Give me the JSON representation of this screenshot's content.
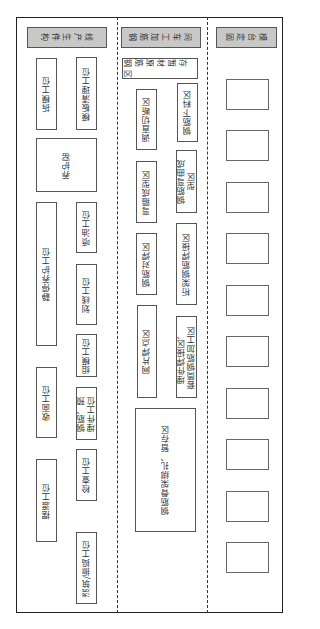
{
  "diagram": {
    "type": "factory-layout",
    "orientation_note": "rotated 90 degrees; labels read bottom-to-top",
    "sections": [
      {
        "id": "production-line",
        "header": "构件生产线",
        "stations": [
          {
            "label": "拆模工位",
            "x": 36,
            "y": 58,
            "w": 21,
            "h": 72
          },
          {
            "label": "模板清理工位",
            "x": 76,
            "y": 57,
            "w": 21,
            "h": 73
          },
          {
            "label": "养护窑",
            "x": 36,
            "y": 138,
            "w": 61,
            "h": 54
          },
          {
            "label": "静停养护工位",
            "x": 36,
            "y": 202,
            "w": 21,
            "h": 144
          },
          {
            "label": "喷油工位",
            "x": 76,
            "y": 202,
            "w": 21,
            "h": 51
          },
          {
            "label": "划线工位",
            "x": 76,
            "y": 264,
            "w": 21,
            "h": 61
          },
          {
            "label": "组模工位",
            "x": 76,
            "y": 334,
            "w": 21,
            "h": 43
          },
          {
            "label": "收面工位",
            "x": 36,
            "y": 367,
            "w": 21,
            "h": 71
          },
          {
            "label": "钢筋、预\n埋件工位",
            "x": 76,
            "y": 387,
            "w": 21,
            "h": 53
          },
          {
            "label": "检查工位",
            "x": 76,
            "y": 449,
            "w": 21,
            "h": 52
          },
          {
            "label": "摆渡工位",
            "x": 36,
            "y": 459,
            "w": 21,
            "h": 83
          },
          {
            "label": "浇筑/振捣工位",
            "x": 76,
            "y": 532,
            "w": 21,
            "h": 72
          }
        ]
      },
      {
        "id": "rebar-workshop",
        "header": "钢筋加工车间",
        "areas": [
          {
            "label": "钢筋原材暂存区",
            "x": 122,
            "y": 58,
            "w": 76,
            "h": 21,
            "horizontal": true
          },
          {
            "label": "钢筋下料区",
            "x": 177,
            "y": 83,
            "w": 21,
            "h": 59
          },
          {
            "label": "调直切断区",
            "x": 136,
            "y": 89,
            "w": 21,
            "h": 61
          },
          {
            "label": "钢筋弯曲成\n型区",
            "x": 176,
            "y": 150,
            "w": 21,
            "h": 63
          },
          {
            "label": "弯箍成型区",
            "x": 136,
            "y": 161,
            "w": 21,
            "h": 62
          },
          {
            "label": "桁架钢筋焊接区",
            "x": 176,
            "y": 223,
            "w": 21,
            "h": 82
          },
          {
            "label": "钢筋对焊区",
            "x": 136,
            "y": 233,
            "w": 21,
            "h": 62
          },
          {
            "label": "网片焊点区",
            "x": 137,
            "y": 305,
            "w": 20,
            "h": 93
          },
          {
            "label": "埋件焊接区、\n套筒钢筋加工区",
            "x": 176,
            "y": 316,
            "w": 21,
            "h": 82
          },
          {
            "label": "钢筋骨架绑扎、暂存区",
            "x": 135,
            "y": 408,
            "w": 61,
            "h": 124
          }
        ]
      },
      {
        "id": "fixed-molds",
        "header": "固定台模",
        "slots": [
          {
            "y": 79
          },
          {
            "y": 130
          },
          {
            "y": 182
          },
          {
            "y": 233
          },
          {
            "y": 285
          },
          {
            "y": 336
          },
          {
            "y": 388
          },
          {
            "y": 439
          },
          {
            "y": 491
          },
          {
            "y": 542
          }
        ],
        "slot_x": 226,
        "slot_w": 43,
        "slot_h": 31
      }
    ]
  },
  "colors": {
    "header_fill": "#c8c8c8",
    "border": "#222222",
    "box_border": "#555555"
  }
}
